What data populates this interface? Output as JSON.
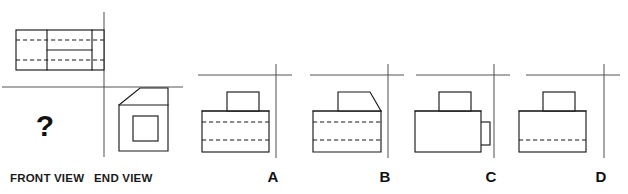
{
  "puzzle": {
    "type": "orthographic-projection-multiple-choice",
    "question_mark": "?",
    "labels": {
      "front_view": "FRONT VIEW",
      "end_view": "END VIEW"
    },
    "options": [
      {
        "letter": "A"
      },
      {
        "letter": "B"
      },
      {
        "letter": "C"
      },
      {
        "letter": "D"
      }
    ],
    "colors": {
      "line": "#1a1a1a",
      "axis": "#555555",
      "background": "#ffffff",
      "text": "#111111"
    }
  },
  "given_views": {
    "plan_view": {
      "name": "plan-view",
      "description": "top rectangle with two vertical dividers and two horizontal hidden dashed lines"
    },
    "end_view": {
      "name": "end-view",
      "description": "rectangle with chamfered top-left corner containing a centered square"
    },
    "front_view": {
      "name": "front-view-missing",
      "description": "missing view indicated by question mark"
    }
  },
  "answer_choices": {
    "A": {
      "description": "body rectangle with raised rectangular boss on top, two horizontal hidden dashed lines"
    },
    "B": {
      "description": "body rectangle chamfered at top right with raised boss chamfered right, two horizontal hidden dashed lines"
    },
    "C": {
      "description": "plain body rectangle with raised boss on top and small tab on right side, no hidden lines"
    },
    "D": {
      "description": "body rectangle with raised boss on top and one lower horizontal hidden dashed line"
    }
  }
}
